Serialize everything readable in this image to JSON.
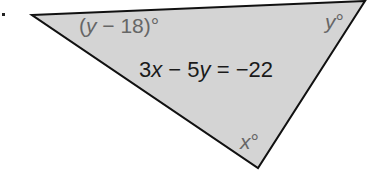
{
  "figure": {
    "bullet": ".",
    "triangle": {
      "vertices": [
        [
          32,
          15
        ],
        [
          365,
          1
        ],
        [
          258,
          168
        ]
      ],
      "fill": "#d4d4d4",
      "stroke": "#111111"
    },
    "angles": {
      "left": {
        "open": "(",
        "var": "y",
        "rest": " − 18)°"
      },
      "top_right": {
        "var": "y",
        "deg": "°"
      },
      "bottom": {
        "var": "x",
        "deg": "°"
      }
    },
    "equation": {
      "c1": "3",
      "v1": "x",
      "op1": " − 5",
      "v2": "y",
      "rest": " = −22"
    }
  }
}
